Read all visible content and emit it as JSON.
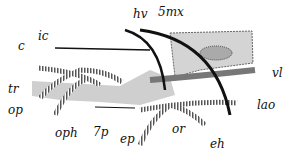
{
  "diagram": {
    "type": "anatomical-nerve-diagram",
    "labels": {
      "hv": "hv",
      "smx": "5mx",
      "ic": "ic",
      "c": "c",
      "tr": "tr",
      "op": "op",
      "oph": "oph",
      "p7": "7p",
      "ep": "ep",
      "or": "or",
      "eh": "eh",
      "lao": "lao",
      "vl": "vl"
    },
    "colors": {
      "background": "#ffffff",
      "gray_body": "#cfcfcf",
      "nerve_stripe": "#555555",
      "ink": "#111111"
    }
  }
}
